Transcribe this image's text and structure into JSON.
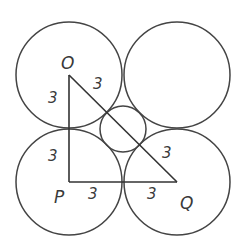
{
  "diagram": {
    "colors": {
      "stroke": "#444444",
      "text": "#3a3a3a",
      "background": "#ffffff"
    },
    "points": {
      "O": {
        "label": "O",
        "x": 69,
        "y": 75
      },
      "P": {
        "label": "P",
        "x": 69,
        "y": 182
      },
      "Q": {
        "label": "Q",
        "x": 177,
        "y": 182
      },
      "R": {
        "x": 177,
        "y": 75
      }
    },
    "circles": [
      {
        "name": "circle-top-left",
        "cx": 69,
        "cy": 75,
        "r": 53
      },
      {
        "name": "circle-top-right",
        "cx": 177,
        "cy": 75,
        "r": 53
      },
      {
        "name": "circle-bottom-left",
        "cx": 69,
        "cy": 182,
        "r": 53
      },
      {
        "name": "circle-bottom-right",
        "cx": 177,
        "cy": 182,
        "r": 53
      },
      {
        "name": "circle-center-small",
        "cx": 123,
        "cy": 129,
        "r": 23
      }
    ],
    "segments": [
      {
        "name": "segment-op",
        "from": "O",
        "to": "P"
      },
      {
        "name": "segment-pq",
        "from": "P",
        "to": "Q"
      },
      {
        "name": "segment-oq",
        "from": "O",
        "to": "Q"
      }
    ],
    "labels": {
      "vertex_o": "O",
      "vertex_p": "P",
      "vertex_q": "Q",
      "op_upper": "3",
      "op_lower": "3",
      "oq_upper": "3",
      "oq_lower": "3",
      "pq_left": "3",
      "pq_right": "3"
    }
  }
}
